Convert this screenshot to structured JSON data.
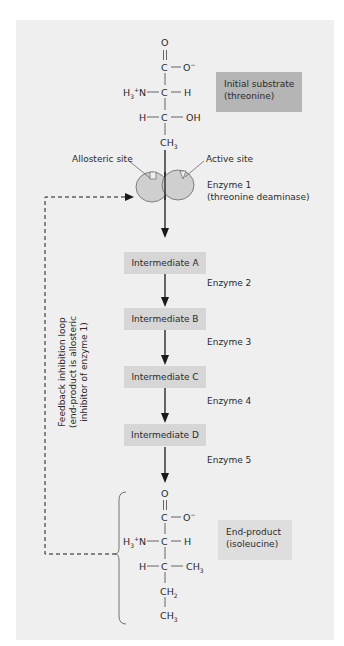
{
  "initial_substrate": {
    "label_line1": "Initial substrate",
    "label_line2": "(threonine)",
    "structure": {
      "o_top": "O",
      "c1": "C",
      "o_minus": "O",
      "o_minus_charge": "−",
      "nh3": "H",
      "nh3_sub": "3",
      "nh3_sup": "+",
      "nh3_n": "N",
      "c2": "C",
      "h_right": "H",
      "h_left": "H",
      "c3": "C",
      "oh": "OH",
      "ch3": "CH",
      "ch3_sub": "3"
    }
  },
  "enzyme1": {
    "allosteric_label": "Allosteric site",
    "active_label": "Active site",
    "name_line1": "Enzyme 1",
    "name_line2": "(threonine deaminase)",
    "color": "#cfcfcf"
  },
  "intermediates": [
    {
      "label": "Intermediate A"
    },
    {
      "label": "Intermediate B"
    },
    {
      "label": "Intermediate C"
    },
    {
      "label": "Intermediate D"
    }
  ],
  "enzymes": [
    {
      "label": "Enzyme 2"
    },
    {
      "label": "Enzyme 3"
    },
    {
      "label": "Enzyme 4"
    },
    {
      "label": "Enzyme 5"
    }
  ],
  "feedback": {
    "line1": "Feedback inhibition loop",
    "line2": "(end-product is allosteric",
    "line3": "inhibitor of enzyme 1)"
  },
  "end_product": {
    "label_line1": "End-product",
    "label_line2": "(isoleucine)",
    "structure": {
      "o_top": "O",
      "c1": "C",
      "o_minus": "O",
      "o_minus_charge": "−",
      "nh3": "H",
      "nh3_sub": "3",
      "nh3_sup": "+",
      "nh3_n": "N",
      "c2": "C",
      "h_right": "H",
      "h_left": "H",
      "c3": "C",
      "ch3_right": "CH",
      "ch3_right_sub": "3",
      "ch2": "CH",
      "ch2_sub": "2",
      "ch3": "CH",
      "ch3_sub": "3"
    }
  },
  "colors": {
    "panel": "#efefef",
    "dark_box": "#b5b5b5",
    "light_box": "#d6d6d6",
    "arrow": "#1a1a1a"
  }
}
